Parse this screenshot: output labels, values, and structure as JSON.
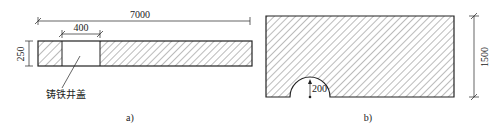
{
  "figure_a": {
    "caption": "a)",
    "dim_total_length": "7000",
    "dim_cover_width": "400",
    "dim_thickness": "250",
    "cover_label": "铸铁井盖"
  },
  "figure_b": {
    "caption": "b)",
    "dim_height": "1500",
    "dim_radius": "200"
  },
  "colors": {
    "line": "#222222",
    "hatch": "#555555",
    "background": "#ffffff"
  }
}
